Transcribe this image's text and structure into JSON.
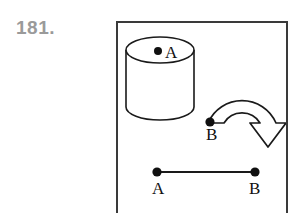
{
  "problem": {
    "number_label": "181.",
    "number_color": "#9a9a9a"
  },
  "figure": {
    "frame_color": "#3a3a3a",
    "ink_color": "#1a1a1a",
    "background": "#ffffff",
    "cylinder": {
      "name": "cylinder",
      "point_label": "A",
      "point_description": "filled dot on top elliptical face"
    },
    "rotation_arrow": {
      "name": "curved-rotation-arrow",
      "direction": "clockwise",
      "start_point_label": "B",
      "arrowhead": "open outlined triangle pointing down-right"
    },
    "segment": {
      "name": "line-segment",
      "left_endpoint_label": "A",
      "right_endpoint_label": "B"
    }
  },
  "labels": {
    "cylinder_point": "A",
    "arrow_point": "B",
    "segment_left": "A",
    "segment_right": "B"
  }
}
